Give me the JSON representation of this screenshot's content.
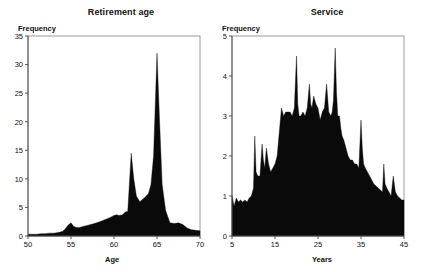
{
  "page": {
    "background": "#ffffff",
    "fill_color": "#0a0a0a",
    "frame_color": "#9a9a9a",
    "axis_color": "#555555"
  },
  "charts": [
    {
      "id": "retirement",
      "title": "Retirement age",
      "ylabel": "Frequency",
      "xlabel": "Age"
    },
    {
      "id": "service",
      "title": "Service",
      "ylabel": "Frequency",
      "xlabel": "Years"
    }
  ],
  "chart_data": [
    {
      "type": "area",
      "title": "Retirement age",
      "xlabel": "Age",
      "ylabel": "Frequency",
      "xlim": [
        50,
        70
      ],
      "ylim": [
        0,
        35
      ],
      "xticks": [
        50,
        55,
        60,
        65,
        70
      ],
      "yticks": [
        0,
        5,
        10,
        15,
        20,
        25,
        30,
        35
      ],
      "grid": false,
      "legend": "none",
      "x": [
        50,
        50.5,
        51,
        51.5,
        52,
        52.5,
        53,
        53.5,
        54,
        54.3,
        54.6,
        55,
        55.3,
        55.6,
        56,
        56.5,
        57,
        57.5,
        58,
        58.5,
        59,
        59.5,
        60,
        60.3,
        60.6,
        61,
        61.3,
        61.6,
        62,
        62.3,
        62.6,
        63,
        63.3,
        63.6,
        64,
        64.3,
        64.6,
        65,
        65.3,
        65.6,
        66,
        66.5,
        67,
        67.5,
        68,
        68.5,
        69,
        69.5,
        70
      ],
      "values": [
        0.3,
        0.3,
        0.3,
        0.4,
        0.4,
        0.5,
        0.5,
        0.6,
        0.8,
        1.2,
        1.8,
        2.3,
        1.7,
        1.5,
        1.5,
        1.7,
        1.9,
        2.1,
        2.3,
        2.6,
        2.9,
        3.2,
        3.6,
        3.7,
        3.6,
        3.7,
        4.2,
        4.3,
        14.5,
        10.0,
        7.0,
        6.0,
        6.4,
        6.8,
        7.4,
        9.0,
        14.0,
        32.0,
        20.0,
        9.0,
        4.5,
        2.3,
        2.2,
        2.3,
        2.0,
        1.4,
        1.1,
        1.0,
        0.9
      ],
      "notes": "Bimodal filled density; small bump near age 55 (~2.3), secondary peak ~14.5 at age 62, dominant peak ~32 at age 65"
    },
    {
      "type": "area",
      "title": "Service",
      "xlabel": "Years",
      "ylabel": "Frequency",
      "xlim": [
        5,
        45
      ],
      "ylim": [
        0,
        5
      ],
      "xticks": [
        5,
        15,
        25,
        35,
        45
      ],
      "yticks": [
        0,
        1,
        2,
        3,
        4,
        5
      ],
      "grid": false,
      "legend": "none",
      "x": [
        5,
        5.5,
        6,
        6.5,
        7,
        7.5,
        8,
        8.5,
        9,
        9.5,
        10,
        10.3,
        10.6,
        11,
        11.5,
        12,
        12.3,
        12.6,
        13,
        13.5,
        14,
        14.5,
        15,
        15.5,
        16,
        16.5,
        17,
        17.5,
        18,
        18.5,
        19,
        19.5,
        20,
        20.3,
        20.6,
        21,
        21.5,
        22,
        22.5,
        23,
        23.3,
        23.6,
        24,
        24.5,
        25,
        25.5,
        26,
        26.5,
        27,
        27.5,
        28,
        28.3,
        28.6,
        29,
        29.3,
        29.6,
        30,
        30.3,
        30.6,
        31,
        31.5,
        32,
        32.5,
        33,
        33.5,
        34,
        34.5,
        35,
        35.3,
        35.6,
        36,
        36.5,
        37,
        37.5,
        38,
        38.5,
        39,
        39.5,
        40,
        40.3,
        40.6,
        41,
        41.5,
        42,
        42.5,
        43,
        43.5,
        44,
        44.5,
        45
      ],
      "values": [
        1.0,
        0.75,
        0.95,
        0.85,
        0.9,
        0.85,
        0.9,
        0.85,
        0.95,
        1.0,
        1.2,
        2.5,
        1.6,
        1.5,
        1.5,
        2.3,
        1.9,
        1.7,
        2.2,
        1.8,
        1.6,
        1.7,
        1.8,
        2.0,
        2.6,
        3.2,
        3.0,
        3.1,
        3.1,
        3.1,
        3.0,
        3.2,
        4.5,
        3.3,
        3.0,
        3.0,
        3.1,
        3.0,
        3.2,
        3.8,
        3.3,
        3.2,
        3.5,
        3.3,
        3.2,
        2.9,
        3.1,
        3.2,
        3.8,
        3.1,
        3.0,
        3.1,
        3.4,
        4.7,
        3.6,
        3.0,
        3.0,
        2.7,
        2.5,
        2.4,
        2.2,
        2.0,
        1.9,
        1.9,
        1.8,
        1.8,
        1.7,
        2.9,
        2.2,
        1.8,
        1.7,
        1.6,
        1.5,
        1.4,
        1.3,
        1.25,
        1.2,
        1.15,
        1.1,
        1.8,
        1.3,
        1.2,
        1.1,
        1.0,
        1.5,
        1.1,
        1.0,
        0.95,
        0.9,
        0.9
      ],
      "notes": "Jagged filled density, low (~0.9) at left, rising around year 16, broad plateau near 3 between years 16-31 with spikes to 4.5 (year 20) and 4.7 (year 29), declining after year 32 with a spike to 2.9 at year 35"
    }
  ]
}
